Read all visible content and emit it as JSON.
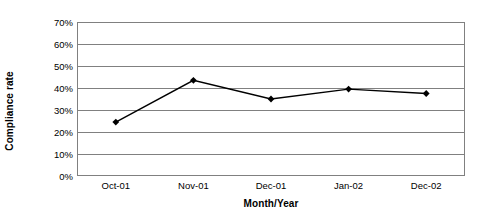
{
  "chart_data": {
    "type": "line",
    "title": "",
    "xlabel": "Month/Year",
    "ylabel": "Compliance rate",
    "categories": [
      "Oct-01",
      "Nov-01",
      "Dec-01",
      "Jan-02",
      "Dec-02"
    ],
    "series": [
      {
        "name": "Compliance rate",
        "values": [
          24.5,
          43.5,
          35.0,
          39.5,
          37.5
        ],
        "color": "#000000",
        "marker": "diamond"
      }
    ],
    "ylim": [
      0,
      70
    ],
    "ytick_values": [
      70,
      60,
      50,
      40,
      30,
      20,
      10,
      0
    ],
    "ytick_labels": [
      "70%",
      "60%",
      "50%",
      "40%",
      "30%",
      "20%",
      "10%",
      "0%"
    ],
    "grid": true,
    "grid_axis": "y",
    "legend": false,
    "legend_position": "none",
    "plot_border_color": "#808080",
    "gridline_color": "#808080",
    "background_color": "#ffffff"
  }
}
